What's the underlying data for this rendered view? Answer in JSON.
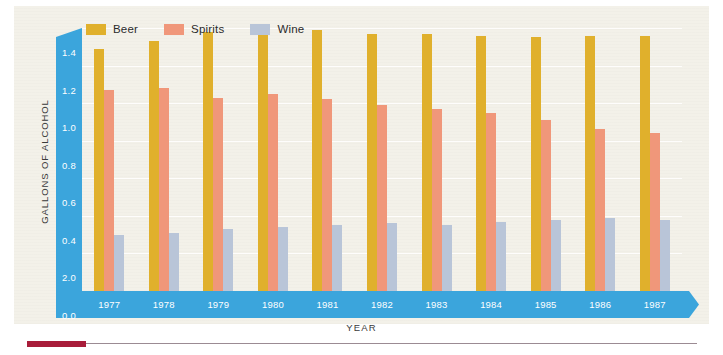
{
  "chart_data": {
    "type": "bar",
    "title": "",
    "xlabel": "YEAR",
    "ylabel": "GALLONS OF ALCOHOL",
    "categories": [
      "1977",
      "1978",
      "1979",
      "1980",
      "1981",
      "1982",
      "1983",
      "1984",
      "1985",
      "1986",
      "1987"
    ],
    "series": [
      {
        "name": "Beer",
        "color": "#e0b02c",
        "values": [
          1.29,
          1.33,
          1.38,
          1.38,
          1.39,
          1.37,
          1.37,
          1.36,
          1.35,
          1.36,
          1.36
        ]
      },
      {
        "name": "Spirits",
        "color": "#f0977a",
        "values": [
          1.07,
          1.08,
          1.03,
          1.05,
          1.02,
          0.99,
          0.97,
          0.95,
          0.91,
          0.86,
          0.84
        ]
      },
      {
        "name": "Wine",
        "color": "#b9c5d8",
        "values": [
          0.3,
          0.31,
          0.33,
          0.34,
          0.35,
          0.36,
          0.35,
          0.37,
          0.38,
          0.39,
          0.38
        ]
      }
    ],
    "ylim": [
      0.0,
      1.4
    ],
    "ytick_labels": [
      "1.4",
      "1.2",
      "1.0",
      "0.8",
      "0.6",
      "0.4",
      "2.0",
      "0.0"
    ],
    "ytick_values": [
      1.4,
      1.2,
      1.0,
      0.8,
      0.6,
      0.4,
      0.2,
      0.0
    ],
    "grid": true,
    "legend_position": "top-left"
  },
  "legend": {
    "items": [
      {
        "label": "Beer",
        "color": "#e0b02c"
      },
      {
        "label": "Spirits",
        "color": "#f0977a"
      },
      {
        "label": "Wine",
        "color": "#b9c5d8"
      }
    ]
  },
  "colors": {
    "axis_band": "#3ba5dc",
    "background": "#f3f1e9",
    "accent_rule": "#a81d3a",
    "gridline": "#ffffff"
  }
}
